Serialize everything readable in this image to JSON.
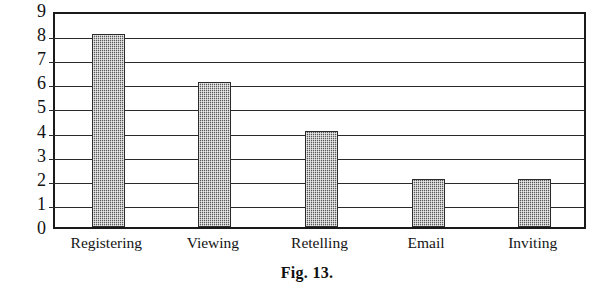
{
  "figure": {
    "caption": "Fig. 13."
  },
  "chart_data": {
    "type": "bar",
    "title": "",
    "subtitle": "",
    "xlabel": "",
    "ylabel": "",
    "categories": [
      "Registering",
      "Viewing",
      "Retelling",
      "Email",
      "Inviting"
    ],
    "values": [
      8,
      6,
      4,
      2,
      2
    ],
    "series": [
      {
        "name": "",
        "values": [
          8,
          6,
          4,
          2,
          2
        ]
      }
    ],
    "ylim": [
      0,
      9
    ],
    "ytick_labels": [
      "0",
      "1",
      "2",
      "3",
      "4",
      "5",
      "6",
      "7",
      "8",
      "9"
    ],
    "ytick_values": [
      0,
      1,
      2,
      3,
      4,
      5,
      6,
      7,
      8,
      9
    ],
    "ytick_interval": 1,
    "grid": true,
    "grid_axis": "y",
    "legend": false,
    "legend_position": "none",
    "annotations": [],
    "bar_fill_color": "#808080",
    "bar_fill_pattern": "dithered-gray-checker",
    "bar_border_color": "#2b2b2b",
    "frame_color": "#1a1a1a",
    "background_color": "#ffffff"
  }
}
